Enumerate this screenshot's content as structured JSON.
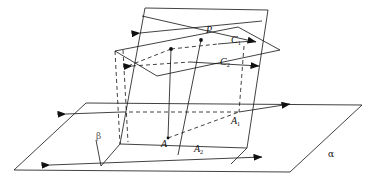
{
  "figure": {
    "stroke_color": "#111111",
    "background": "#ffffff",
    "width": 372,
    "height": 182
  },
  "labels": {
    "P": {
      "text": "P",
      "x": 206,
      "y": 30,
      "italic": true
    },
    "C1": {
      "text": "C",
      "sub": "1",
      "x": 233,
      "y": 40,
      "italic": true
    },
    "C2": {
      "text": "C",
      "sub": "2",
      "x": 222,
      "y": 62,
      "italic": true
    },
    "A": {
      "text": "A",
      "x": 163,
      "y": 142,
      "italic": true
    },
    "A1": {
      "text": "A",
      "sub": "1",
      "x": 232,
      "y": 120,
      "italic": true
    },
    "A2": {
      "text": "A",
      "sub": "2",
      "x": 196,
      "y": 148,
      "italic": true
    },
    "beta": {
      "text": "β",
      "x": 97,
      "y": 136,
      "italic": false
    },
    "alpha": {
      "text": "α",
      "x": 330,
      "y": 155,
      "italic": false
    }
  },
  "points": {
    "P": {
      "x": 201,
      "y": 40
    },
    "A": {
      "x": 168,
      "y": 138
    },
    "A1": {
      "x": 239,
      "y": 112
    },
    "mid_left": {
      "x": 171,
      "y": 49
    }
  },
  "planes": {
    "alpha_horizontal": {
      "name": "plane-alpha",
      "vertices": [
        [
          14,
          170
        ],
        [
          86,
          103
        ],
        [
          362,
          105
        ],
        [
          290,
          172
        ]
      ]
    },
    "beta_slanted": {
      "name": "plane-beta",
      "vertices": [
        [
          145,
          8
        ],
        [
          268,
          10
        ],
        [
          247,
          148
        ],
        [
          120,
          144
        ]
      ]
    },
    "third_plane": {
      "name": "plane-third",
      "vertices": [
        [
          115,
          51
        ],
        [
          238,
          27
        ],
        [
          280,
          50
        ],
        [
          157,
          76
        ]
      ]
    }
  },
  "lines": {
    "crossing_upper_1": {
      "from": [
        136,
        34
      ],
      "to": [
        262,
        22
      ],
      "style": "solid"
    },
    "crossing_upper_2": {
      "from": [
        142,
        16
      ],
      "to": [
        258,
        44
      ],
      "style": "solid"
    },
    "c1_axis": {
      "from": [
        133,
        32
      ],
      "to": [
        253,
        25
      ],
      "style": "mixed"
    },
    "c2_axis": {
      "from": [
        128,
        66
      ],
      "to": [
        262,
        64
      ],
      "style": "mixed"
    },
    "a2_axis": {
      "from": [
        46,
        165
      ],
      "to": [
        265,
        157
      ],
      "style": "solid"
    },
    "a1_axis": {
      "from": [
        62,
        116
      ],
      "to": [
        296,
        104
      ],
      "style": "mixed"
    },
    "vertical_PA": {
      "from": [
        201,
        40
      ],
      "to": [
        178,
        155
      ],
      "style": "solid"
    }
  },
  "arrows": [
    {
      "name": "arrow-upper-left",
      "x": 136,
      "y": 34,
      "dir": "left"
    },
    {
      "name": "arrow-upper-right",
      "x": 256,
      "y": 24,
      "dir": "right"
    },
    {
      "name": "arrow-c2-left",
      "x": 128,
      "y": 66,
      "dir": "left"
    },
    {
      "name": "arrow-c2-right",
      "x": 263,
      "y": 66,
      "dir": "right"
    },
    {
      "name": "arrow-a1-left",
      "x": 62,
      "y": 113,
      "dir": "left"
    },
    {
      "name": "arrow-a1-right",
      "x": 292,
      "y": 103,
      "dir": "right"
    },
    {
      "name": "arrow-a2-left",
      "x": 46,
      "y": 165,
      "dir": "left"
    },
    {
      "name": "arrow-a2-right",
      "x": 266,
      "y": 157,
      "dir": "right"
    }
  ]
}
